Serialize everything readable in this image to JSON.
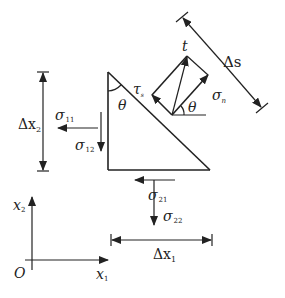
{
  "diagram": {
    "type": "stress-element-free-body",
    "labels": {
      "delta_x2": {
        "base": "Δx",
        "sub": "2"
      },
      "delta_x1": {
        "base": "Δx",
        "sub": "1"
      },
      "delta_s": {
        "base": "Δs",
        "sub": ""
      },
      "sigma11": {
        "base": "σ",
        "sub": "11"
      },
      "sigma12": {
        "base": "σ",
        "sub": "12"
      },
      "sigma21": {
        "base": "σ",
        "sub": "21"
      },
      "sigma22": {
        "base": "σ",
        "sub": "22"
      },
      "sigma_n": {
        "base": "σ",
        "sub": "n"
      },
      "tau_s": {
        "base": "τ",
        "sub": "s"
      },
      "t": "t",
      "theta_triangle": "θ",
      "theta_vector": "θ",
      "axis_x1": {
        "base": "x",
        "sub": "1"
      },
      "axis_x2": {
        "base": "x",
        "sub": "2"
      },
      "origin": "O"
    },
    "colors": {
      "ink": "#222222",
      "background": "#ffffff"
    }
  }
}
